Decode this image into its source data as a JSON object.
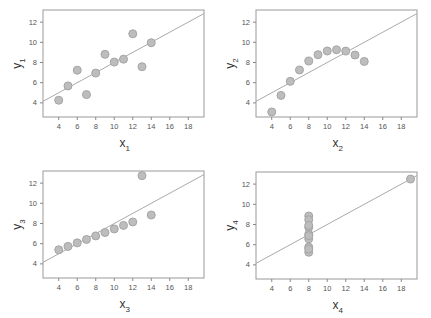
{
  "chart_data": [
    {
      "type": "scatter",
      "title": "",
      "xlabel": "x",
      "xlabel_sub": "1",
      "ylabel": "y",
      "ylabel_sub": "1",
      "xticks": [
        4,
        6,
        8,
        10,
        12,
        14,
        16,
        18
      ],
      "yticks": [
        4,
        6,
        8,
        10,
        12
      ],
      "xlim": [
        2.3,
        19.7
      ],
      "ylim": [
        2.6,
        13.2
      ],
      "x": [
        10,
        8,
        13,
        9,
        11,
        14,
        6,
        4,
        12,
        7,
        5
      ],
      "y": [
        8.04,
        6.95,
        7.58,
        8.81,
        8.33,
        9.96,
        7.24,
        4.26,
        10.84,
        4.82,
        5.68
      ],
      "fit_line": {
        "intercept": 3.0,
        "slope": 0.5
      }
    },
    {
      "type": "scatter",
      "title": "",
      "xlabel": "x",
      "xlabel_sub": "2",
      "ylabel": "y",
      "ylabel_sub": "2",
      "xticks": [
        4,
        6,
        8,
        10,
        12,
        14,
        16,
        18
      ],
      "yticks": [
        4,
        6,
        8,
        10,
        12
      ],
      "xlim": [
        2.3,
        19.7
      ],
      "ylim": [
        2.6,
        13.2
      ],
      "x": [
        10,
        8,
        13,
        9,
        11,
        14,
        6,
        4,
        12,
        7,
        5
      ],
      "y": [
        9.14,
        8.14,
        8.74,
        8.77,
        9.26,
        8.1,
        6.13,
        3.1,
        9.13,
        7.26,
        4.74
      ],
      "fit_line": {
        "intercept": 3.0,
        "slope": 0.5
      }
    },
    {
      "type": "scatter",
      "title": "",
      "xlabel": "x",
      "xlabel_sub": "3",
      "ylabel": "y",
      "ylabel_sub": "3",
      "xticks": [
        4,
        6,
        8,
        10,
        12,
        14,
        16,
        18
      ],
      "yticks": [
        4,
        6,
        8,
        10,
        12
      ],
      "xlim": [
        2.3,
        19.7
      ],
      "ylim": [
        2.6,
        13.2
      ],
      "x": [
        10,
        8,
        13,
        9,
        11,
        14,
        6,
        4,
        12,
        7,
        5
      ],
      "y": [
        7.46,
        6.77,
        12.74,
        7.11,
        7.81,
        8.84,
        6.08,
        5.39,
        8.15,
        6.42,
        5.73
      ],
      "fit_line": {
        "intercept": 3.0,
        "slope": 0.5
      }
    },
    {
      "type": "scatter",
      "title": "",
      "xlabel": "x",
      "xlabel_sub": "4",
      "ylabel": "y",
      "ylabel_sub": "4",
      "xticks": [
        4,
        6,
        8,
        10,
        12,
        14,
        16,
        18
      ],
      "yticks": [
        4,
        6,
        8,
        10,
        12
      ],
      "xlim": [
        2.3,
        19.7
      ],
      "ylim": [
        2.6,
        13.2
      ],
      "x": [
        8,
        8,
        8,
        8,
        8,
        8,
        8,
        19,
        8,
        8,
        8
      ],
      "y": [
        6.58,
        5.76,
        7.71,
        8.84,
        8.47,
        7.04,
        5.25,
        12.5,
        5.56,
        7.91,
        6.89
      ],
      "fit_line": {
        "intercept": 3.0,
        "slope": 0.5
      }
    }
  ],
  "panels": [
    {
      "left": 43,
      "top": 10,
      "width": 161,
      "height": 107
    },
    {
      "left": 256,
      "top": 10,
      "width": 161,
      "height": 107
    },
    {
      "left": 43,
      "top": 171,
      "width": 161,
      "height": 107
    },
    {
      "left": 256,
      "top": 172,
      "width": 161,
      "height": 107
    }
  ],
  "colors": {
    "point_fill": "#bdbdbd",
    "point_stroke": "#a5a5a5",
    "line": "#aaaaaa",
    "frame": "#999999"
  }
}
